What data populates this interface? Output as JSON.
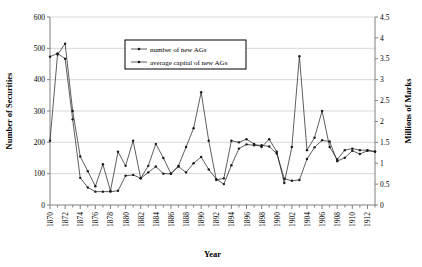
{
  "chart_data": {
    "type": "line",
    "title": "",
    "xlabel": "Year",
    "ylabel": "Number of Securities",
    "y2label": "Millions of Marks",
    "xlim": [
      1870,
      1913
    ],
    "ylim": [
      0,
      600
    ],
    "y2lim": [
      0,
      4.5
    ],
    "grid": true,
    "legend_position": "top-center",
    "xticks": [
      1870,
      1872,
      1874,
      1876,
      1878,
      1880,
      1882,
      1884,
      1886,
      1888,
      1890,
      1892,
      1894,
      1896,
      1898,
      1900,
      1902,
      1904,
      1906,
      1908,
      1910,
      1912
    ],
    "xtick_labels": [
      "1870",
      "1872",
      "1874",
      "1876",
      "1878",
      "1880",
      "1882",
      "1884",
      "1886",
      "1888",
      "1890",
      "1892",
      "1894",
      "1896",
      "1898",
      "1900",
      "1902",
      "1904",
      "1906",
      "1908",
      "1910",
      "1912"
    ],
    "yticks": [
      0,
      100,
      200,
      300,
      400,
      500,
      600
    ],
    "ytick_labels": [
      "0",
      "100",
      "200",
      "300",
      "400",
      "500",
      "600"
    ],
    "y2ticks": [
      0,
      0.5,
      1,
      1.5,
      2,
      2.5,
      3,
      3.5,
      4,
      4.5
    ],
    "y2tick_labels": [
      "0",
      "0.5",
      "1",
      "1.5",
      "2",
      "2.5",
      "3",
      "3.5",
      "4",
      "4.5"
    ],
    "x": [
      1870,
      1871,
      1872,
      1873,
      1874,
      1875,
      1876,
      1877,
      1878,
      1879,
      1880,
      1881,
      1882,
      1883,
      1884,
      1885,
      1886,
      1887,
      1888,
      1889,
      1890,
      1891,
      1892,
      1893,
      1894,
      1895,
      1896,
      1897,
      1898,
      1899,
      1900,
      1901,
      1902,
      1903,
      1904,
      1905,
      1906,
      1907,
      1908,
      1909,
      1910,
      1911,
      1912,
      1913
    ],
    "series": [
      {
        "name": "number of new AGs",
        "axis": "left",
        "values": [
          205,
          480,
          515,
          300,
          155,
          108,
          60,
          130,
          45,
          170,
          125,
          205,
          85,
          125,
          195,
          150,
          100,
          125,
          185,
          245,
          360,
          205,
          80,
          85,
          205,
          200,
          210,
          195,
          185,
          210,
          170,
          70,
          185,
          475,
          175,
          215,
          300,
          185,
          145,
          175,
          180,
          175,
          175,
          170
        ]
      },
      {
        "name": "average capital of new AGs",
        "axis": "right",
        "values": [
          3.55,
          3.63,
          3.5,
          2.05,
          0.65,
          0.42,
          0.32,
          0.32,
          0.32,
          0.34,
          0.7,
          0.72,
          0.64,
          0.78,
          0.92,
          0.75,
          0.75,
          0.92,
          0.78,
          1.0,
          1.15,
          0.85,
          0.62,
          0.5,
          0.95,
          1.35,
          1.45,
          1.43,
          1.43,
          1.4,
          1.23,
          0.63,
          0.58,
          0.6,
          1.1,
          1.38,
          1.55,
          1.52,
          1.05,
          1.13,
          1.3,
          1.22,
          1.3,
          1.28
        ]
      }
    ]
  },
  "legend": {
    "items": [
      {
        "label": "number of new AGs"
      },
      {
        "label": "average capital of new AGs"
      }
    ]
  },
  "axes": {
    "left_title": "Number of Securities",
    "right_title": "Millions of Marks",
    "bottom_title": "Year"
  },
  "colors": {
    "line": "#1a1a1a",
    "grid": "#d9d9d9",
    "axis": "#808080",
    "background": "#ffffff"
  }
}
